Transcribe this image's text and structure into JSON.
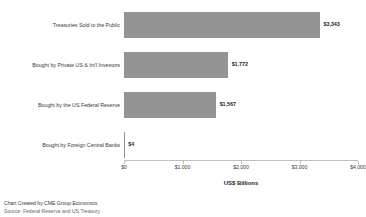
{
  "chart_data": {
    "type": "bar",
    "orientation": "horizontal",
    "title": "",
    "xlabel": "US$ Billions",
    "ylabel": "",
    "xlim": [
      0,
      4000
    ],
    "grid": false,
    "legend": null,
    "categories": [
      "Treasuries Sold to the Public",
      "Bought by Private US & Int'l Investors",
      "Bought by the US Federal Reserve",
      "Bought by Foreign Central Banks"
    ],
    "values": [
      3343,
      1772,
      1567,
      4
    ],
    "value_labels": [
      "$3,343",
      "$1,772",
      "$1,567",
      "$4"
    ],
    "xticks": [
      0,
      1000,
      2000,
      3000,
      4000
    ],
    "xtick_labels": [
      "$0",
      "$1,000",
      "$2,000",
      "$3,000",
      "$4,000"
    ],
    "bar_color": "#949494"
  },
  "footer": {
    "line1": "Chart Created by CME Group Economics",
    "line2": "Source: Federal Reserve and US Treasury"
  }
}
